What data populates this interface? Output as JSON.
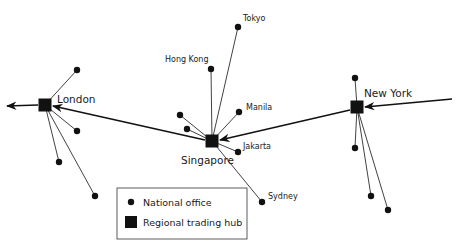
{
  "diagram": {
    "hubs": [
      {
        "id": "london",
        "label": "London",
        "x": 45,
        "y": 105,
        "lx": 57,
        "ly": 103,
        "size": 13
      },
      {
        "id": "singapore",
        "label": "Singapore",
        "x": 212,
        "y": 141,
        "lx": 181,
        "ly": 164,
        "size": 13
      },
      {
        "id": "newyork",
        "label": "New York",
        "x": 357,
        "y": 107,
        "lx": 364,
        "ly": 97,
        "size": 13
      }
    ],
    "offices": [
      {
        "id": "tokyo",
        "label": "Tokyo",
        "hub": "singapore",
        "x": 238,
        "y": 27,
        "lx": 243,
        "ly": 21
      },
      {
        "id": "hongkong",
        "label": "Hong Kong",
        "hub": "singapore",
        "x": 211,
        "y": 69,
        "lx": 165,
        "ly": 62
      },
      {
        "id": "manila",
        "label": "Manila",
        "hub": "singapore",
        "x": 239,
        "y": 112,
        "lx": 246,
        "ly": 110
      },
      {
        "id": "jakarta",
        "label": "Jakarta",
        "hub": "singapore",
        "x": 238,
        "y": 152,
        "lx": 243,
        "ly": 149
      },
      {
        "id": "sydney",
        "label": "Sydney",
        "hub": "singapore",
        "x": 262,
        "y": 202,
        "lx": 268,
        "ly": 199
      },
      {
        "id": "sg-office-1",
        "label": "",
        "hub": "singapore",
        "x": 180,
        "y": 115
      },
      {
        "id": "sg-office-2",
        "label": "",
        "hub": "singapore",
        "x": 187,
        "y": 129
      },
      {
        "id": "ldn-office-1",
        "label": "",
        "hub": "london",
        "x": 77,
        "y": 70
      },
      {
        "id": "ldn-office-2",
        "label": "",
        "hub": "london",
        "x": 77,
        "y": 131
      },
      {
        "id": "ldn-office-3",
        "label": "",
        "hub": "london",
        "x": 59,
        "y": 162
      },
      {
        "id": "ldn-office-4",
        "label": "",
        "hub": "london",
        "x": 95,
        "y": 196
      },
      {
        "id": "ny-office-1",
        "label": "",
        "hub": "newyork",
        "x": 355,
        "y": 78
      },
      {
        "id": "ny-office-2",
        "label": "",
        "hub": "newyork",
        "x": 355,
        "y": 148
      },
      {
        "id": "ny-office-3",
        "label": "",
        "hub": "newyork",
        "x": 371,
        "y": 196
      },
      {
        "id": "ny-office-4",
        "label": "",
        "hub": "newyork",
        "x": 388,
        "y": 210
      }
    ],
    "flows": [
      {
        "from": "incoming-east",
        "to": "newyork",
        "x1": 452,
        "y1": 99,
        "x2": 365,
        "y2": 107
      },
      {
        "from": "newyork",
        "to": "singapore",
        "x1": 350,
        "y1": 110,
        "x2": 220,
        "y2": 140
      },
      {
        "from": "singapore",
        "to": "london",
        "x1": 205,
        "y1": 140,
        "x2": 53,
        "y2": 106
      },
      {
        "from": "london",
        "to": "outgoing-west",
        "x1": 38,
        "y1": 105,
        "x2": 7,
        "y2": 106
      }
    ],
    "legend": {
      "x": 117,
      "y": 188,
      "w": 130,
      "h": 51,
      "items": [
        {
          "symbol": "dot",
          "label": "National office"
        },
        {
          "symbol": "square",
          "label": "Regional trading hub"
        }
      ]
    },
    "colors": {
      "ink": "#111111",
      "text": "#1a1a1a",
      "background": "#ffffff"
    }
  }
}
